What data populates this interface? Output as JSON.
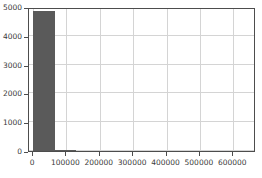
{
  "chart_data": {
    "type": "bar",
    "title": "",
    "subtitle": "",
    "xlabel": "",
    "ylabel": "",
    "grid": true,
    "legend": false,
    "legend_position": "none",
    "bar_color": "#5a5a5a",
    "grid_color": "#d4d4d4",
    "frame_color": "#4d4d4d",
    "background_color": "#ffffff",
    "xlim": [
      -12000,
      668000
    ],
    "ylim": [
      0,
      5000
    ],
    "yticks": [
      0,
      1000,
      2000,
      3000,
      4000,
      5000
    ],
    "ytick_labels": [
      "0",
      "1000",
      "2000",
      "3000",
      "4000",
      "5000"
    ],
    "xticks": [
      0,
      100000,
      200000,
      300000,
      400000,
      500000,
      600000
    ],
    "xtick_labels": [
      "0",
      "100000",
      "200000",
      "300000",
      "400000",
      "500000",
      "600000"
    ],
    "bins": [
      {
        "x0": 0,
        "x1": 65000,
        "value": 4870
      },
      {
        "x0": 65000,
        "x1": 130000,
        "value": 25
      }
    ],
    "categories": [
      "0-65000",
      "65000-130000"
    ],
    "values": [
      4870,
      25
    ]
  }
}
